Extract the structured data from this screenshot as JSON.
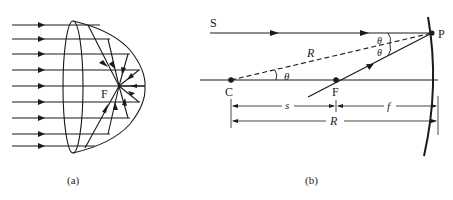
{
  "figure": {
    "panel_a": {
      "caption": "(a)",
      "focus_label": "F",
      "ray_count": 9
    },
    "panel_b": {
      "caption": "(b)",
      "labels": {
        "source": "S",
        "point": "P",
        "center": "C",
        "focus": "F",
        "radius_dashed": "R",
        "theta_axis": "θ",
        "theta_top": "θ",
        "theta_bottom": "θ",
        "distance_s": "s",
        "distance_f": "f",
        "distance_R": "R"
      }
    },
    "colors": {
      "line": "#1a1a1a",
      "background": "#ffffff"
    }
  }
}
